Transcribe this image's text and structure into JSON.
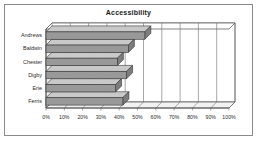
{
  "chart_data": {
    "type": "bar",
    "orientation": "horizontal",
    "style": "3d",
    "title": "Accessibility",
    "xlabel": "",
    "ylabel": "",
    "categories": [
      "Andrews",
      "Baldwin",
      "Chester",
      "Digby",
      "Erie",
      "Ferris"
    ],
    "values": [
      54,
      45,
      39,
      44,
      38,
      42
    ],
    "xlim": [
      0,
      100
    ],
    "x_tick_labels": [
      "0%",
      "10%",
      "20%",
      "30%",
      "40%",
      "50%",
      "60%",
      "70%",
      "80%",
      "90%",
      "100%"
    ],
    "x_tick_values": [
      0,
      10,
      20,
      30,
      40,
      50,
      60,
      70,
      80,
      90,
      100
    ],
    "grid": true,
    "legend": null,
    "bar_color": "#999999",
    "bar_edge_color": "#333333",
    "plot_background": "#ffffff",
    "frame_color": "#8a8a8a"
  }
}
